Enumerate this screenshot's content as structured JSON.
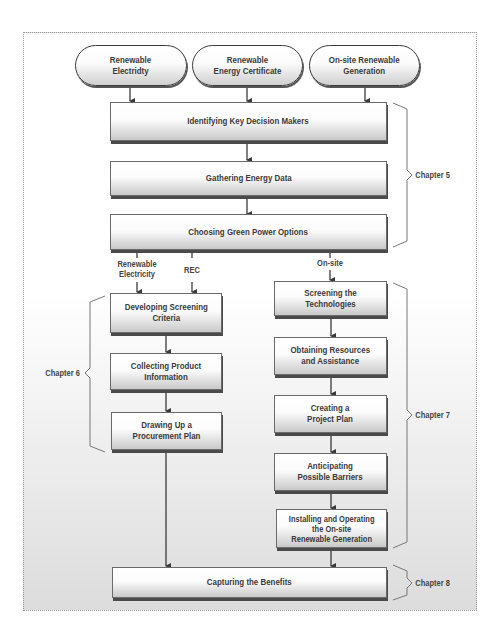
{
  "diagram": {
    "sources": [
      {
        "id": "renewable-electricity",
        "label": "Renewable\nElectridty"
      },
      {
        "id": "rec",
        "label": "Renewable\nEnergy Certificate"
      },
      {
        "id": "onsite",
        "label": "On-site Renewable\nGeneration"
      }
    ],
    "common_steps": [
      {
        "id": "identify",
        "label": "Identifying Key Decision Makers"
      },
      {
        "id": "gather",
        "label": "Gathering Energy Data"
      },
      {
        "id": "choose",
        "label": "Choosing Green Power Options"
      }
    ],
    "branch_labels": {
      "renewable_electricity": "Renewable\nElectricity",
      "rec": "REC",
      "onsite": "On-site"
    },
    "left_steps": [
      {
        "id": "screening-criteria",
        "label": "Developing Screening\nCriteria"
      },
      {
        "id": "collecting",
        "label": "Collecting Product\nInformation"
      },
      {
        "id": "procurement",
        "label": "Drawing Up a\nProcurement Plan"
      }
    ],
    "right_steps": [
      {
        "id": "screening-tech",
        "label": "Screening the Technologies"
      },
      {
        "id": "resources",
        "label": "Obtaining Resources\nand Assistance"
      },
      {
        "id": "project-plan",
        "label": "Creating a\nProject Plan"
      },
      {
        "id": "barriers",
        "label": "Anticipating\nPossible Barriers"
      },
      {
        "id": "installing",
        "label": "Installing and Operating\nthe On-site\nRenewable Generation"
      }
    ],
    "final_step": {
      "id": "benefits",
      "label": "Capturing the Benefits"
    },
    "chapters": {
      "ch5": "Chapter 5",
      "ch6": "Chapter 6",
      "ch7": "Chapter 7",
      "ch8": "Chapter 8"
    },
    "colors": {
      "line": "#3a3a3a",
      "bracket": "#666666",
      "text": "#3a3a3a"
    }
  }
}
